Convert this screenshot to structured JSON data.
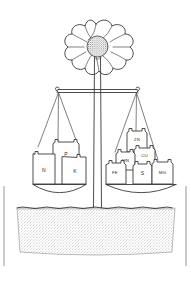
{
  "figure": {
    "style": {
      "ink_color": "#3a3a3a",
      "background_color": "#ffffff",
      "soil_tone": "#9a9a9a"
    }
  },
  "plant": {
    "flower_name": "flower-head",
    "petal_count": 8,
    "center_name": "flower-center-disc",
    "stem_name": "plant-stem"
  },
  "balance": {
    "beam_name": "balance-beam",
    "fulcrum_name": "balance-fulcrum",
    "left_pan_label": "Macronutrients",
    "right_pan_label": "Micronutrients"
  },
  "left_pan": {
    "name": "left-balance-pan",
    "weights": [
      {
        "label": "P",
        "name": "weight-p",
        "x": 66,
        "y": 144,
        "w": 22,
        "h": 26,
        "font": "normal"
      },
      {
        "label": "N",
        "name": "weight-n",
        "x": 40,
        "y": 155,
        "w": 27,
        "h": 30,
        "font": "normal"
      },
      {
        "label": "K",
        "name": "weight-k",
        "x": 72,
        "y": 158,
        "w": 27,
        "h": 27,
        "font": "normal"
      }
    ]
  },
  "right_pan": {
    "name": "right-balance-pan",
    "weights": [
      {
        "label": "ZN",
        "name": "weight-zn",
        "x": 129,
        "y": 132,
        "w": 17,
        "h": 20,
        "font": "small"
      },
      {
        "label": "CU",
        "name": "weight-cu",
        "x": 136,
        "y": 148,
        "w": 18,
        "h": 19,
        "font": "small"
      },
      {
        "label": "MN",
        "name": "weight-mn",
        "x": 119,
        "y": 152,
        "w": 18,
        "h": 17,
        "font": "small"
      },
      {
        "label": "FE",
        "name": "weight-fe",
        "x": 108,
        "y": 164,
        "w": 18,
        "h": 21,
        "font": "small"
      },
      {
        "label": "S",
        "name": "weight-s",
        "x": 134,
        "y": 165,
        "w": 18,
        "h": 20,
        "font": "normal"
      },
      {
        "label": "MG",
        "name": "weight-mg",
        "x": 153,
        "y": 163,
        "w": 20,
        "h": 22,
        "font": "small"
      }
    ]
  },
  "ground": {
    "name": "soil-bed",
    "ground_line_name": "ground-surface-line"
  }
}
